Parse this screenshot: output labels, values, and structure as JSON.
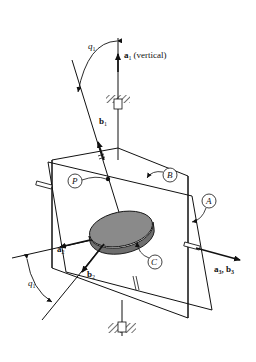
{
  "diagram": {
    "type": "mechanical-gyroscope-schematic",
    "labels": {
      "a1": "a",
      "a1_sub": "1",
      "a1_note": "(vertical)",
      "b1": "b",
      "b1_sub": "1",
      "a2": "a",
      "a2_sub": "2",
      "b2": "b",
      "b2_sub": "2",
      "a3b3": "a",
      "a3b3_sub1": "3",
      "a3b3_sep": ", b",
      "a3b3_sub2": "3",
      "q1_top": "q",
      "q1_top_sub": "1",
      "q1_bottom": "q",
      "q1_bottom_sub": "1",
      "P": "P",
      "A": "A",
      "B": "B",
      "C": "C"
    },
    "colors": {
      "line": "#111111",
      "disk_fill": "#8a8a8a",
      "disk_side": "#6e6e6e",
      "background": "#ffffff"
    }
  }
}
